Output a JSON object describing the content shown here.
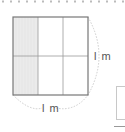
{
  "diagram": {
    "title": "",
    "grid": {
      "rows": 2,
      "columns": 3,
      "shaded_columns": [
        0
      ]
    },
    "dimensions": {
      "right_label": "l m",
      "bottom_label": "l m"
    },
    "colors": {
      "border": "#777777",
      "grid_line": "#999999",
      "shade": "#ebebeb",
      "arc": "#cccccc",
      "dots": "#bbbbbb"
    }
  }
}
